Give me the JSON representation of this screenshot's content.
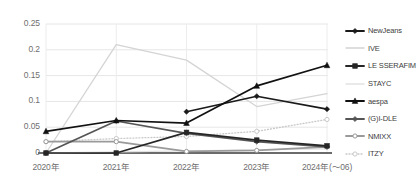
{
  "chart_data": {
    "type": "line",
    "title": "",
    "xlabel": "",
    "ylabel": "",
    "categories": [
      "2020年",
      "2021年",
      "2022年",
      "2023年",
      "2024年(〜06)"
    ],
    "ylim": [
      0,
      0.25
    ],
    "yticks": [
      "0",
      "0.05",
      "0.1",
      "0.15",
      "0.2",
      "0.25"
    ],
    "ytick_values": [
      0,
      0.05,
      0.1,
      0.15,
      0.2,
      0.25
    ],
    "grid": true,
    "legend_position": "right",
    "series": [
      {
        "name": "NewJeans",
        "color": "#1a1a1a",
        "marker": "diamond",
        "linestyle": "solid",
        "values": [
          null,
          null,
          0.08,
          0.11,
          0.085
        ]
      },
      {
        "name": "IVE",
        "color": "#d4d4d4",
        "marker": "none",
        "linestyle": "solid",
        "values": [
          0.0,
          0.21,
          0.18,
          0.09,
          0.115
        ]
      },
      {
        "name": "LE SSERAFIM",
        "color": "#262626",
        "marker": "square",
        "linestyle": "solid",
        "values": [
          0.0,
          0.0,
          0.04,
          0.025,
          0.014
        ]
      },
      {
        "name": "STAYC",
        "color": "#e2e2e2",
        "marker": "none",
        "linestyle": "solid",
        "values": [
          0.0,
          0.002,
          0.004,
          0.006,
          0.008
        ]
      },
      {
        "name": "aespa",
        "color": "#111111",
        "marker": "triangle",
        "linestyle": "solid",
        "values": [
          0.042,
          0.063,
          0.058,
          0.13,
          0.17
        ]
      },
      {
        "name": "(G)I-DLE",
        "color": "#555555",
        "marker": "diamond",
        "linestyle": "solid",
        "values": [
          0.0,
          0.062,
          0.038,
          0.022,
          0.012
        ]
      },
      {
        "name": "NMIXX",
        "color": "#9a9a9a",
        "marker": "circle-open",
        "linestyle": "solid",
        "values": [
          0.022,
          0.022,
          0.003,
          0.005,
          0.012
        ]
      },
      {
        "name": "ITZY",
        "color": "#c9c9c9",
        "marker": "circle-open",
        "linestyle": "dotted",
        "values": [
          0.022,
          0.028,
          0.032,
          0.042,
          0.065
        ]
      }
    ]
  }
}
